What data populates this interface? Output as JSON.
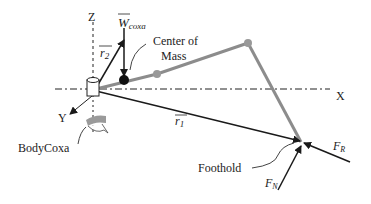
{
  "diagram": {
    "axes": {
      "x_label": "X",
      "y_label": "Y",
      "z_label": "Z"
    },
    "vectors": {
      "r1": {
        "label": "r",
        "subscript": "1"
      },
      "r2": {
        "label": "r",
        "subscript": "2"
      },
      "w_coxa": {
        "label": "W",
        "subscript": "coxa"
      },
      "f_r": {
        "label": "F",
        "subscript": "R"
      },
      "f_n": {
        "label": "F",
        "subscript": "N"
      }
    },
    "annotations": {
      "center_of_mass_line1": "Center of",
      "center_of_mass_line2": "Mass",
      "body_coxa": "BodyCoxa",
      "foothold": "Foothold"
    },
    "colors": {
      "leg": "#8c8c8c",
      "vector": "#1a1a1a",
      "joint": "#999999",
      "mass": "#111111",
      "coxa_band": "#9a9a9a"
    }
  }
}
